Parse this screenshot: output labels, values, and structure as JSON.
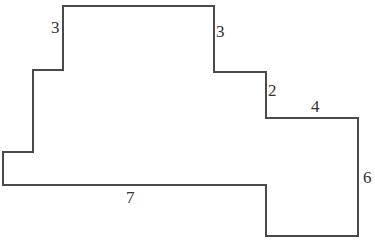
{
  "diagram": {
    "type": "rectilinear-polygon",
    "stroke_color": "#4a4a4a",
    "background": "#ffffff",
    "outline_points": [
      [
        63,
        6
      ],
      [
        214,
        6
      ],
      [
        214,
        72
      ],
      [
        266,
        72
      ],
      [
        266,
        118
      ],
      [
        358,
        118
      ],
      [
        358,
        236
      ],
      [
        266,
        236
      ],
      [
        266,
        185
      ],
      [
        3,
        185
      ],
      [
        3,
        152
      ],
      [
        33,
        152
      ],
      [
        33,
        70
      ],
      [
        63,
        70
      ]
    ],
    "labels": [
      {
        "text": "3",
        "x": 51,
        "y": 33
      },
      {
        "text": "3",
        "x": 216,
        "y": 37
      },
      {
        "text": "2",
        "x": 268,
        "y": 96
      },
      {
        "text": "4",
        "x": 311,
        "y": 112
      },
      {
        "text": "6",
        "x": 363,
        "y": 183
      },
      {
        "text": "7",
        "x": 126,
        "y": 203
      }
    ]
  }
}
